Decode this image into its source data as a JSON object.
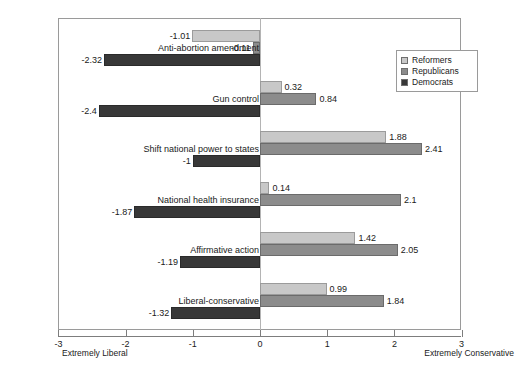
{
  "chart_data": {
    "type": "bar",
    "orientation": "horizontal",
    "title": "",
    "xlabel": "",
    "ylabel": "",
    "xlim": [
      -3,
      3
    ],
    "xticks": [
      -3,
      -2,
      -1,
      0,
      1,
      2,
      3
    ],
    "xtick_labels": [
      "-3",
      "-2",
      "-1",
      "0",
      "1",
      "2",
      "3"
    ],
    "grid": false,
    "legend_position": "upper right",
    "axis_end_labels": {
      "left": "Extremely Liberal",
      "right": "Extremely Conservative"
    },
    "categories": [
      "Anti-abortion amendment",
      "Gun control",
      "Shift national power to states",
      "National health insurance",
      "Affirmative action",
      "Liberal-conservative"
    ],
    "series": [
      {
        "name": "Reformers",
        "color": "#c8c8c8",
        "values": [
          -1.01,
          0.32,
          1.88,
          0.14,
          1.42,
          0.99
        ],
        "value_labels": [
          "-1.01",
          "0.32",
          "1.88",
          "0.14",
          "1.42",
          "0.99"
        ]
      },
      {
        "name": "Republicans",
        "color": "#8c8c8c",
        "values": [
          -0.11,
          0.84,
          2.41,
          2.1,
          2.05,
          1.84
        ],
        "value_labels": [
          "-0.11",
          "0.84",
          "2.41",
          "2.1",
          "2.05",
          "1.84"
        ]
      },
      {
        "name": "Democrats",
        "color": "#383838",
        "values": [
          -2.32,
          -2.4,
          -1.0,
          -1.87,
          -1.19,
          -1.32
        ],
        "value_labels": [
          "-2.32",
          "-2.4",
          "-1",
          "-1.87",
          "-1.19",
          "-1.32"
        ]
      }
    ]
  },
  "legend": {
    "items": [
      {
        "label": "Reformers"
      },
      {
        "label": "Republicans"
      },
      {
        "label": "Democrats"
      }
    ]
  }
}
